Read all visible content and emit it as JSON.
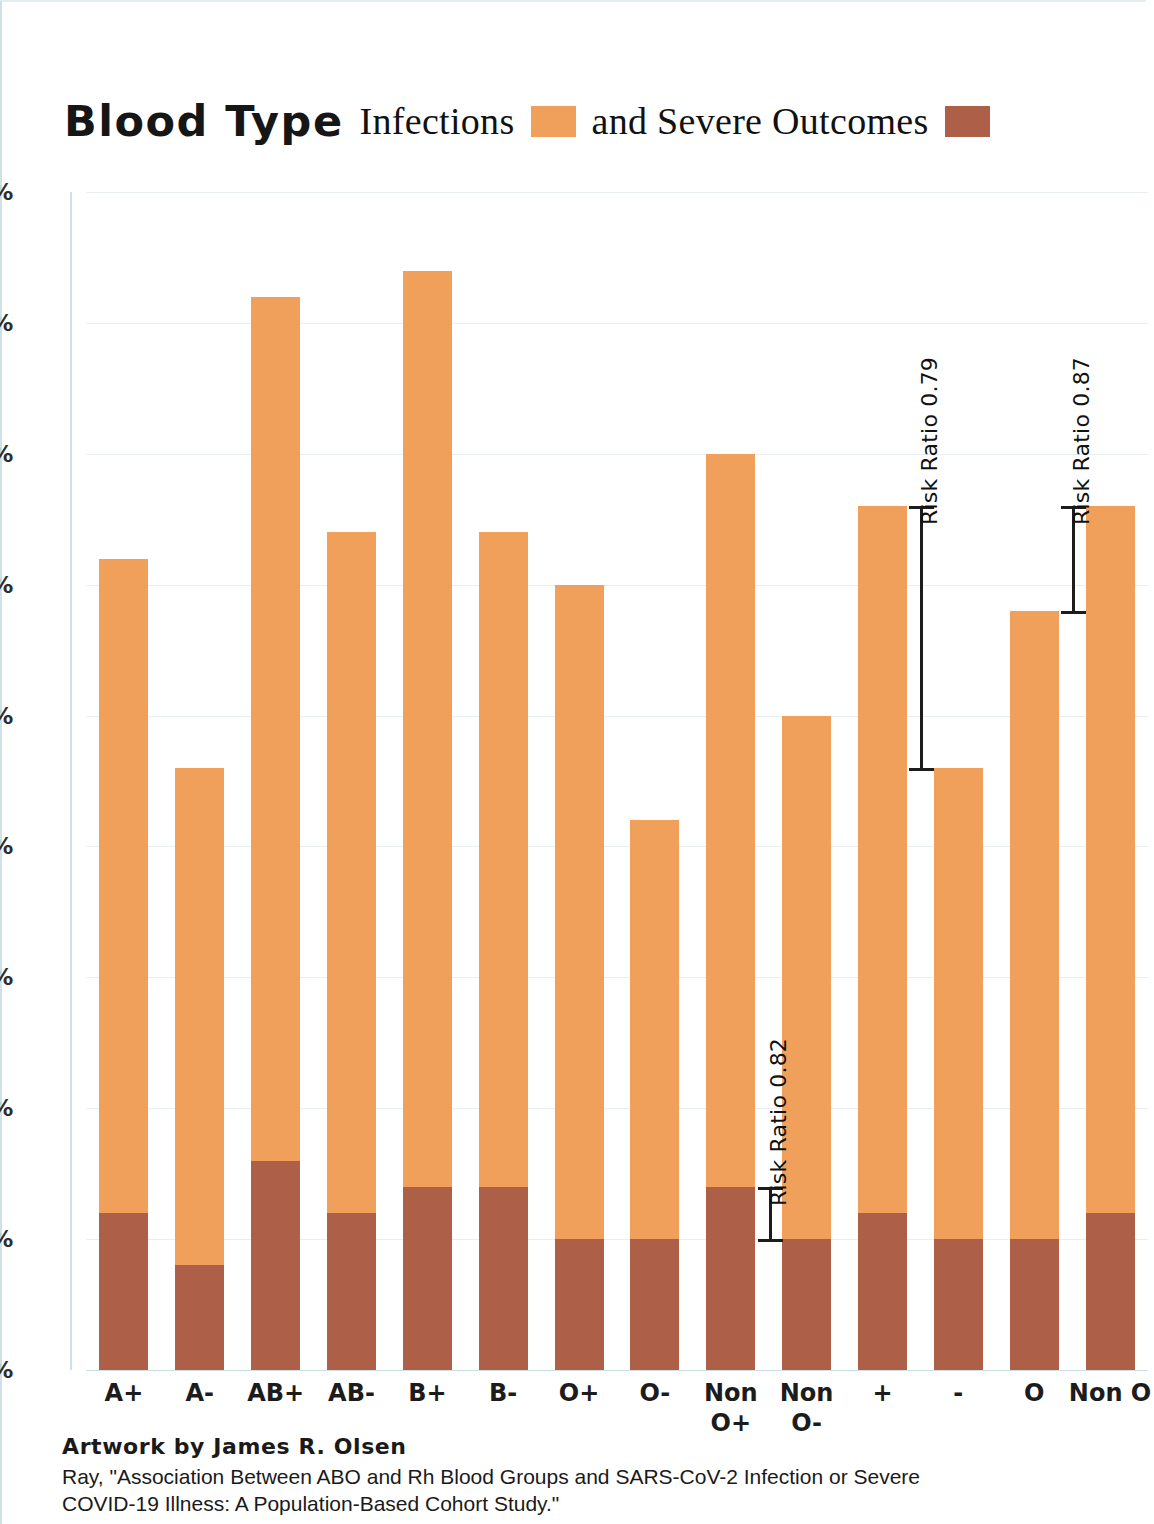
{
  "title": {
    "bold_part": "Blood Type",
    "infections_label": "Infections",
    "middle_label": "and Severe Outcomes",
    "infections_swatch_name": "infections-color-swatch",
    "severe_swatch_name": "severe-outcomes-color-swatch"
  },
  "colors": {
    "infections": "#F0A05A",
    "severe": "#AE5F48",
    "gridline": "#e9eef0",
    "axis": "#cfe0e6",
    "text": "#1a1a1a"
  },
  "footer": {
    "credit": "Artwork by James R. Olsen",
    "citation_line1": "Ray, \"Association Between ABO and Rh Blood Groups and SARS-CoV-2 Infection or Severe",
    "citation_line2": "COVID-19 Illness: A Population-Based Cohort Study.\""
  },
  "chart_data": {
    "type": "bar",
    "title": "Blood Type Infections and Severe Outcomes",
    "xlabel": "",
    "ylabel": "",
    "ylim": [
      0.0,
      4.5
    ],
    "ytick_labels": [
      "4.5%",
      "4.0%",
      "3.5%",
      "3.0%",
      "2.5%",
      "2.0%",
      "1.5%",
      "1.0%",
      "0.5%",
      "0.0%"
    ],
    "ytick_values": [
      4.5,
      4.0,
      3.5,
      3.0,
      2.5,
      2.0,
      1.5,
      1.0,
      0.5,
      0.0
    ],
    "grid": true,
    "stacked": true,
    "legend_position": "title",
    "categories": [
      "A+",
      "A-",
      "AB+",
      "AB-",
      "B+",
      "B-",
      "O+",
      "O-",
      "Non\nO+",
      "Non\nO-",
      "+",
      "-",
      "O",
      "Non O"
    ],
    "series": [
      {
        "name": "Infections",
        "color": "#F0A05A",
        "values": [
          3.1,
          2.3,
          4.1,
          3.2,
          4.2,
          3.2,
          3.0,
          2.1,
          3.5,
          2.5,
          3.3,
          2.3,
          2.9,
          3.3
        ]
      },
      {
        "name": "Severe Outcomes",
        "color": "#AE5F48",
        "values": [
          0.6,
          0.4,
          0.8,
          0.6,
          0.7,
          0.7,
          0.5,
          0.5,
          0.7,
          0.5,
          0.6,
          0.5,
          0.5,
          0.6
        ]
      }
    ],
    "annotations": [
      {
        "label": "Risk Ratio 0.82",
        "from_category": "Non\nO+",
        "to_category": "Non\nO-",
        "from_value": 0.7,
        "to_value": 0.5,
        "name": "risk-ratio-annotation-0-82"
      },
      {
        "label": "Risk Ratio 0.79",
        "from_category": "+",
        "to_category": "-",
        "from_value": 3.3,
        "to_value": 2.3,
        "name": "risk-ratio-annotation-0-79"
      },
      {
        "label": "Risk Ratio 0.87",
        "from_category": "O",
        "to_category": "Non O",
        "from_value": 2.9,
        "to_value": 3.3,
        "name": "risk-ratio-annotation-0-87"
      }
    ]
  }
}
